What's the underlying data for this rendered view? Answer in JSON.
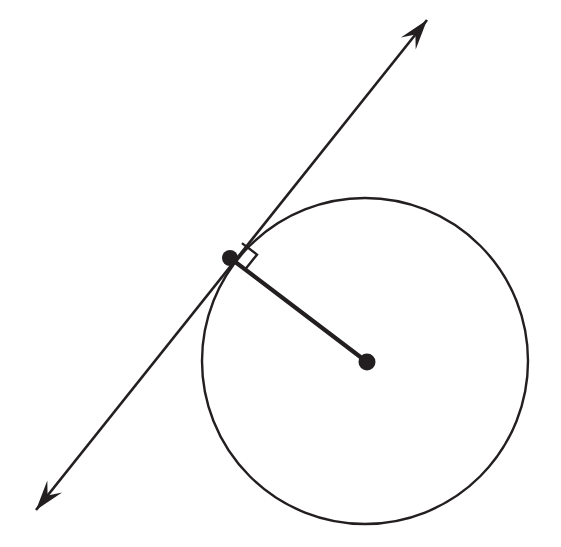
{
  "figure": {
    "title": "Tangent line to a circle with radius drawn to the point of tangency",
    "canvas": {
      "width": 561,
      "height": 547,
      "background": "#ffffff"
    },
    "stroke_color": "#231f20"
  },
  "circle": {
    "name": "circle",
    "center_x": 365,
    "center_y": 361,
    "radius": 163,
    "stroke_width": 2.4
  },
  "center_point": {
    "label": "center-point",
    "x": 367,
    "y": 362,
    "dot_radius": 8.5
  },
  "tangent_point": {
    "label": "tangent-point",
    "x": 230,
    "y": 258,
    "dot_radius": 8.0
  },
  "tangent_line": {
    "label": "tangent-line",
    "x1": 427,
    "y1": 20,
    "x2": 36,
    "y2": 510,
    "stroke_width": 2.6,
    "slope": -1.25,
    "arrowheads": "both-ends"
  },
  "radius_segment": {
    "label": "radius-segment",
    "x1": 230,
    "y1": 258,
    "x2": 367,
    "y2": 362,
    "stroke_width": 4.2
  },
  "right_angle_marker": {
    "label": "right-angle-marker",
    "measure": "90 degrees",
    "size": 19,
    "vertex_x": 230,
    "vertex_y": 258,
    "points": "239.2,247.1 256.6,260.3 245.6,274.8"
  },
  "arrowhead_upper": {
    "label": "arrowhead-upper-right",
    "tip_x": 427,
    "tip_y": 20,
    "points": "427,20 409.5,33.5 415.6,37.0 403.0,48.0"
  },
  "arrowhead_lower": {
    "label": "arrowhead-lower-left",
    "tip_x": 36,
    "tip_y": 510,
    "points": "36,510 53.5,496.5 47.4,493.0 60.0,482.0"
  }
}
